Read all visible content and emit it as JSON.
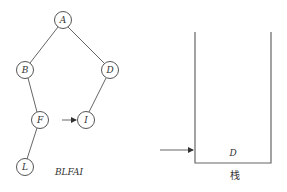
{
  "tree": {
    "nodes": [
      {
        "id": "A",
        "label": "A",
        "x": 63,
        "y": 20
      },
      {
        "id": "B",
        "label": "B",
        "x": 25,
        "y": 70
      },
      {
        "id": "D",
        "label": "D",
        "x": 110,
        "y": 70
      },
      {
        "id": "F",
        "label": "F",
        "x": 40,
        "y": 120
      },
      {
        "id": "I",
        "label": "I",
        "x": 86,
        "y": 120
      },
      {
        "id": "L",
        "label": "L",
        "x": 25,
        "y": 167
      }
    ],
    "edges": [
      [
        "A",
        "B"
      ],
      [
        "A",
        "D"
      ],
      [
        "B",
        "F"
      ],
      [
        "D",
        "I"
      ],
      [
        "F",
        "L"
      ]
    ],
    "pointer_arrow": {
      "from": "F",
      "to": "I"
    },
    "visit_sequence": "BLFAI"
  },
  "stack": {
    "caption": "栈",
    "items": [
      "D"
    ],
    "pointer_arrow": "bottom"
  }
}
